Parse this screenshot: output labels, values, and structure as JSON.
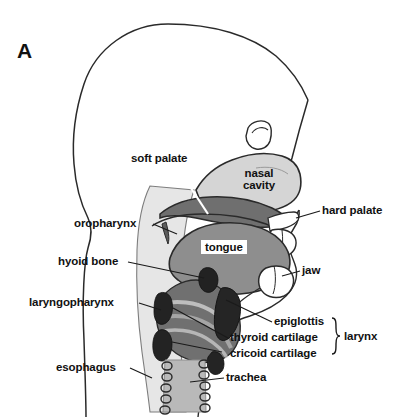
{
  "figure": {
    "panel_label": "A",
    "title_text": "",
    "background_color": "#ffffff",
    "outline_color": "#1a1a1a",
    "label_color": "#111111"
  },
  "regions": {
    "nasal_cavity": {
      "label": "nasal cavity",
      "line1": "nasal",
      "line2": "cavity",
      "fill": "#d2d2d2"
    },
    "tongue": {
      "label": "tongue",
      "fill": "#8d8d8d"
    },
    "soft_palate": {
      "label": "soft palate",
      "fill": "#7a7a7a"
    },
    "pharynx_band": {
      "fill": "#e2e2e2"
    },
    "larynx_mass": {
      "fill": "#5a5a5a"
    },
    "trachea": {
      "fill": "#b9b9b9"
    },
    "cartilage_dark": {
      "fill": "#2b2b2b"
    }
  },
  "labels_left": [
    {
      "name": "soft-palate",
      "text": "soft palate"
    },
    {
      "name": "oropharynx",
      "text": "oropharynx"
    },
    {
      "name": "hyoid-bone",
      "text": "hyoid bone"
    },
    {
      "name": "laryngopharynx",
      "text": "laryngopharynx"
    },
    {
      "name": "esophagus",
      "text": "esophagus"
    }
  ],
  "labels_right": [
    {
      "name": "hard-palate",
      "text": "hard palate"
    },
    {
      "name": "jaw",
      "text": "jaw"
    },
    {
      "name": "epiglottis",
      "text": "epiglottis"
    },
    {
      "name": "thyroid-cartilage",
      "text": "thyroid cartilage"
    },
    {
      "name": "cricoid-cartilage",
      "text": "cricoid cartilage"
    },
    {
      "name": "trachea",
      "text": "trachea"
    },
    {
      "name": "larynx",
      "text": "larynx"
    }
  ],
  "labels_inline": [
    {
      "name": "nasal-cavity",
      "text": "nasal cavity"
    },
    {
      "name": "tongue",
      "text": "tongue"
    }
  ],
  "bracket": {
    "name": "larynx-bracket",
    "groups": [
      "epiglottis",
      "thyroid cartilage",
      "cricoid cartilage"
    ],
    "label": "larynx"
  }
}
